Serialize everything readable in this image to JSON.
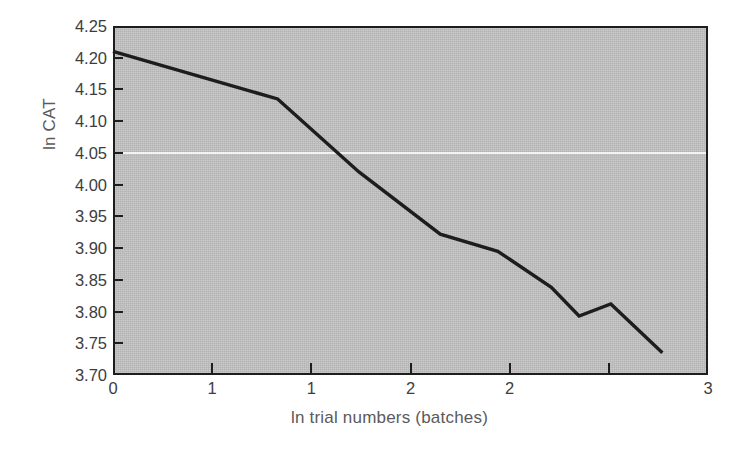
{
  "chart_data": {
    "type": "line",
    "title": "",
    "xlabel": "ln trial numbers (batches)",
    "ylabel": "ln CAT",
    "xlim": [
      0,
      3
    ],
    "ylim": [
      3.7,
      4.25
    ],
    "grid": false,
    "legend": "none",
    "x_tick_values": [
      0,
      0.5,
      1.0,
      1.5,
      2.0,
      2.5,
      3.0
    ],
    "x_tick_labels": [
      "0",
      "1",
      "1",
      "2",
      "2",
      "3"
    ],
    "y_tick_labels": [
      "4.25",
      "4.20",
      "4.15",
      "4.10",
      "4.05",
      "4.00",
      "3.95",
      "3.90",
      "3.85",
      "3.80",
      "3.75",
      "3.70"
    ],
    "y_tick_values": [
      4.25,
      4.2,
      4.15,
      4.1,
      4.05,
      4.0,
      3.95,
      3.9,
      3.85,
      3.8,
      3.75,
      3.7
    ],
    "series": [
      {
        "name": "ln CAT",
        "color": "#1d1d1d",
        "x": [
          0.0,
          0.83,
          1.24,
          1.65,
          1.94,
          2.21,
          2.35,
          2.51,
          2.77
        ],
        "y": [
          4.21,
          4.135,
          4.02,
          3.922,
          3.895,
          3.838,
          3.793,
          3.812,
          3.735
        ]
      }
    ],
    "plot_background_color": "#c3c3c3",
    "frame_color": "#1d1d1d",
    "figure_background_color": "#ffffff"
  },
  "axes": {
    "y_title": "ln CAT",
    "x_title": "ln trial numbers (batches)"
  }
}
